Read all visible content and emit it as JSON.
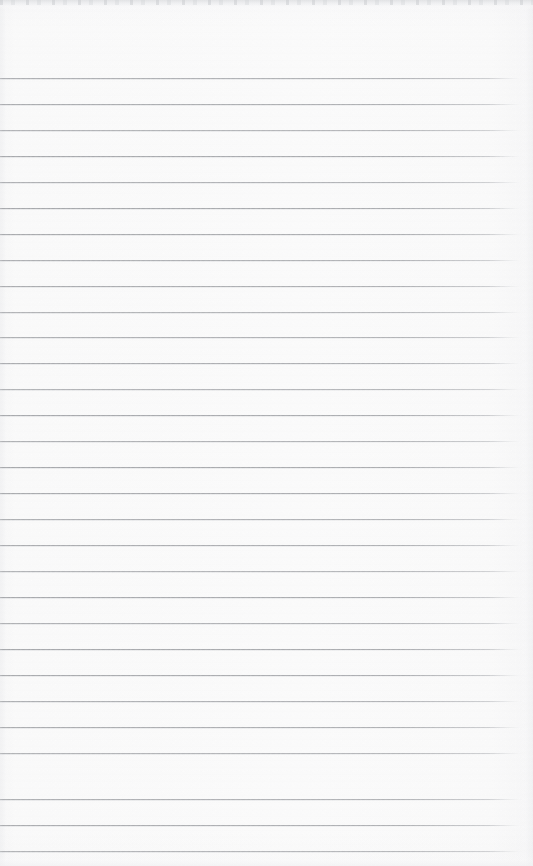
{
  "document": {
    "kind": "scanned-lined-paper",
    "title": "Blank ruled notepad page",
    "content_text": "",
    "handwriting_present": "none",
    "page_width": 533,
    "page_height": 866
  },
  "paper": {
    "background_color": "#fdfdfd",
    "edge_shadow_color": "#dedfe1",
    "grain_color": "#f7f7f8"
  },
  "ruling": {
    "line_color": "#96989c",
    "line_thickness_px": 1,
    "line_spacing_px": 26,
    "first_line_y": 78,
    "line_start_x": 0,
    "line_end_x": 526,
    "line_count": 30,
    "line_y_positions": [
      78,
      104,
      130,
      156,
      182,
      208,
      234,
      260,
      286,
      312,
      337,
      363,
      389,
      415,
      441,
      467,
      493,
      519,
      545,
      571,
      597,
      623,
      649,
      675,
      701,
      727,
      753,
      799,
      825,
      851
    ]
  },
  "artifacts": {
    "top_scan_band_height": 9,
    "top_scan_band_color": "#dedfe1",
    "bottom_scan_band_height": 12,
    "left_gutter_width": 14,
    "right_edge_width": 18,
    "right_fade_start_x": 488
  }
}
